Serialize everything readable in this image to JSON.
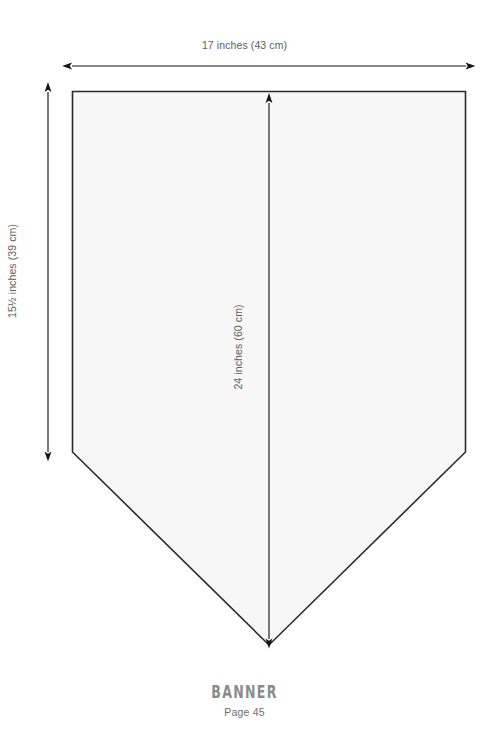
{
  "figure": {
    "shape_name": "banner-pentagon",
    "fill_color": "#f7f7f7",
    "stroke_color": "#2b2b2b",
    "arrow_color": "#151515",
    "dimensions": {
      "width_label": "17 inches (43 cm)",
      "height_label": "15½ inches (39 cm)",
      "diagonal_label": "24 inches (60 cm)"
    }
  },
  "caption": {
    "title": "BANNER",
    "page": "Page 45"
  }
}
